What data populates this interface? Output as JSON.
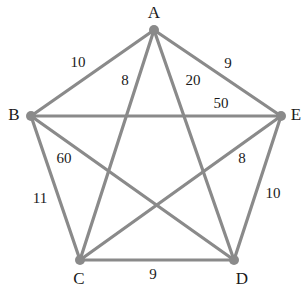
{
  "diagram": {
    "type": "weighted-complete-graph",
    "colors": {
      "edge": "#8a8a8a",
      "node": "#8a8a8a",
      "text": "#1a1a1a",
      "background": "#ffffff"
    },
    "nodes": [
      {
        "id": "A",
        "label": "A",
        "x": 154,
        "y": 30,
        "label_x": 154,
        "label_y": 12
      },
      {
        "id": "B",
        "label": "B",
        "x": 31,
        "y": 116,
        "label_x": 14,
        "label_y": 114
      },
      {
        "id": "C",
        "label": "C",
        "x": 80,
        "y": 260,
        "label_x": 79,
        "label_y": 278
      },
      {
        "id": "D",
        "label": "D",
        "x": 234,
        "y": 260,
        "label_x": 242,
        "label_y": 278
      },
      {
        "id": "E",
        "label": "E",
        "x": 281,
        "y": 116,
        "label_x": 296,
        "label_y": 114
      }
    ],
    "edges": [
      {
        "from": "A",
        "to": "B",
        "weight": "10",
        "label_x": 78,
        "label_y": 62
      },
      {
        "from": "A",
        "to": "C",
        "weight": "8",
        "label_x": 125,
        "label_y": 80
      },
      {
        "from": "A",
        "to": "D",
        "weight": "20",
        "label_x": 193,
        "label_y": 80
      },
      {
        "from": "A",
        "to": "E",
        "weight": "9",
        "label_x": 228,
        "label_y": 63
      },
      {
        "from": "B",
        "to": "E",
        "weight": "50",
        "label_x": 221,
        "label_y": 103
      },
      {
        "from": "B",
        "to": "D",
        "weight": "60",
        "label_x": 64,
        "label_y": 158
      },
      {
        "from": "C",
        "to": "E",
        "weight": "8",
        "label_x": 242,
        "label_y": 158
      },
      {
        "from": "B",
        "to": "C",
        "weight": "11",
        "label_x": 40,
        "label_y": 198
      },
      {
        "from": "D",
        "to": "E",
        "weight": "10",
        "label_x": 273,
        "label_y": 193
      },
      {
        "from": "C",
        "to": "D",
        "weight": "9",
        "label_x": 153,
        "label_y": 274
      }
    ]
  }
}
